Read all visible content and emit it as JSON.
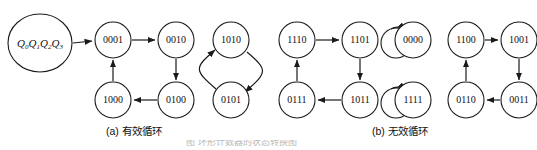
{
  "figure": {
    "background_color": "#ffffff",
    "stroke_color": "#1a1a1a",
    "source_state": {
      "name": "Q0Q1Q2Q3",
      "var": "Q",
      "subscripts": [
        "0",
        "1",
        "2",
        "3"
      ]
    },
    "captions": {
      "a": "(a) 有效循环",
      "b": "(b) 无效循环"
    },
    "bottom_partial_text": "图 环形计数器的状态转换图"
  },
  "graph": {
    "nodes": [
      {
        "id": "n0001",
        "label": "0001",
        "cx": 113,
        "cy": 40,
        "group": "a"
      },
      {
        "id": "n0010",
        "label": "0010",
        "cx": 176,
        "cy": 40,
        "group": "a"
      },
      {
        "id": "n0100",
        "label": "0100",
        "cx": 176,
        "cy": 100,
        "group": "a"
      },
      {
        "id": "n1000",
        "label": "1000",
        "cx": 113,
        "cy": 100,
        "group": "a"
      },
      {
        "id": "n1010",
        "label": "1010",
        "cx": 231,
        "cy": 40,
        "group": "a"
      },
      {
        "id": "n0101",
        "label": "0101",
        "cx": 231,
        "cy": 100,
        "group": "a"
      },
      {
        "id": "n1110",
        "label": "1110",
        "cx": 297,
        "cy": 40,
        "group": "b"
      },
      {
        "id": "n1101",
        "label": "1101",
        "cx": 360,
        "cy": 40,
        "group": "b"
      },
      {
        "id": "n1011",
        "label": "1011",
        "cx": 360,
        "cy": 100,
        "group": "b"
      },
      {
        "id": "n0111",
        "label": "0111",
        "cx": 297,
        "cy": 100,
        "group": "b"
      },
      {
        "id": "n0000",
        "label": "0000",
        "cx": 413,
        "cy": 40,
        "group": "b"
      },
      {
        "id": "n1111",
        "label": "1111",
        "cx": 413,
        "cy": 100,
        "group": "b"
      },
      {
        "id": "n1100",
        "label": "1100",
        "cx": 466,
        "cy": 40,
        "group": "b"
      },
      {
        "id": "n1001",
        "label": "1001",
        "cx": 519,
        "cy": 40,
        "group": "b"
      },
      {
        "id": "n0011",
        "label": "0011",
        "cx": 519,
        "cy": 100,
        "group": "b"
      },
      {
        "id": "n0110",
        "label": "0110",
        "cx": 466,
        "cy": 100,
        "group": "b"
      }
    ],
    "node_radius": 18,
    "edges": [
      {
        "from": "source",
        "to": "n0001",
        "kind": "straight"
      },
      {
        "from": "n0001",
        "to": "n0010",
        "kind": "straight"
      },
      {
        "from": "n0010",
        "to": "n0100",
        "kind": "straight"
      },
      {
        "from": "n0100",
        "to": "n1000",
        "kind": "straight"
      },
      {
        "from": "n1000",
        "to": "n0001",
        "kind": "straight"
      },
      {
        "from": "n1010",
        "to": "n0101",
        "kind": "curved-right"
      },
      {
        "from": "n0101",
        "to": "n1010",
        "kind": "curved-left"
      },
      {
        "from": "n1110",
        "to": "n1101",
        "kind": "straight"
      },
      {
        "from": "n1101",
        "to": "n1011",
        "kind": "straight"
      },
      {
        "from": "n1011",
        "to": "n0111",
        "kind": "straight"
      },
      {
        "from": "n0111",
        "to": "n1110",
        "kind": "straight"
      },
      {
        "from": "n0000",
        "to": "n0000",
        "kind": "self-loop"
      },
      {
        "from": "n1111",
        "to": "n1111",
        "kind": "self-loop"
      },
      {
        "from": "n1100",
        "to": "n1001",
        "kind": "straight"
      },
      {
        "from": "n1001",
        "to": "n0011",
        "kind": "straight"
      },
      {
        "from": "n0011",
        "to": "n0110",
        "kind": "straight"
      },
      {
        "from": "n0110",
        "to": "n1100",
        "kind": "straight"
      }
    ],
    "cycles": {
      "valid": [
        "0001",
        "0010",
        "0100",
        "1000"
      ],
      "invalid_two": [
        "1010",
        "0101"
      ],
      "invalid_four_a": [
        "1110",
        "1101",
        "1011",
        "0111"
      ],
      "invalid_self": [
        "0000",
        "1111"
      ],
      "invalid_four_b": [
        "1100",
        "1001",
        "0011",
        "0110"
      ]
    }
  }
}
